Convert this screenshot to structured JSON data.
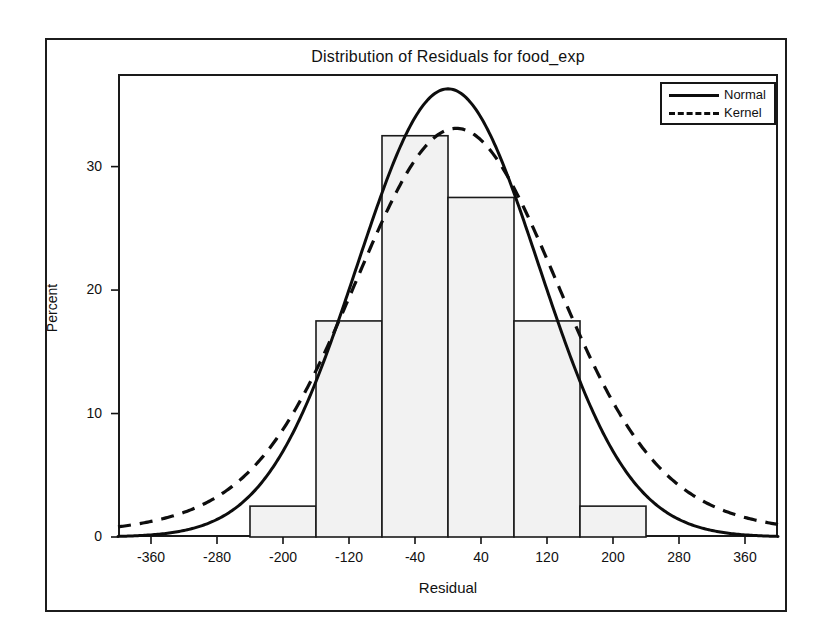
{
  "chart_data": {
    "type": "bar",
    "title": "Distribution of Residuals for food_exp",
    "xlabel": "Residual",
    "ylabel": "Percent",
    "xlim": [
      -400,
      400
    ],
    "ylim": [
      0,
      37.5
    ],
    "grid": false,
    "legend_position": "top-right",
    "xticks": [
      -360,
      -280,
      -200,
      -120,
      -40,
      40,
      120,
      200,
      280,
      360
    ],
    "xtick_labels": [
      "-360",
      "-280",
      "-200",
      "-120",
      "-40",
      "40",
      "120",
      "200",
      "280",
      "360"
    ],
    "yticks": [
      0,
      10,
      20,
      30
    ],
    "ytick_labels": [
      "0",
      "10",
      "20",
      "30"
    ],
    "bin_width": 80,
    "bin_edges": [
      -240,
      -160,
      -80,
      0,
      80,
      160,
      240
    ],
    "categories": [
      "-200",
      "-120",
      "-40",
      "40",
      "120",
      "200"
    ],
    "values": [
      2.5,
      17.5,
      32.5,
      27.5,
      17.5,
      2.5
    ],
    "bar_fill_color": "#f2f2f2",
    "bar_edge_color": "#1a1a1a",
    "series": [
      {
        "name": "Normal",
        "style": "solid",
        "color": "#0d0d0d",
        "type": "line",
        "mean": 0,
        "std": 110,
        "peak_percent": 36.3,
        "description": "Fitted normal density curve scaled to percent"
      },
      {
        "name": "Kernel",
        "style": "dashed",
        "color": "#0d0d0d",
        "type": "line",
        "peak_percent": 33.1,
        "peak_x": 10,
        "description": "Kernel density estimate curve scaled to percent"
      }
    ],
    "legend_entries": [
      {
        "label": "Normal",
        "style": "solid"
      },
      {
        "label": "Kernel",
        "style": "dashed"
      }
    ]
  }
}
